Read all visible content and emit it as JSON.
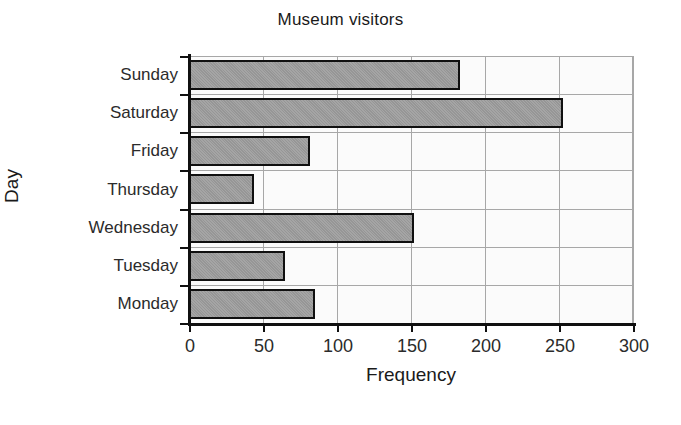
{
  "chart_data": {
    "type": "bar",
    "orientation": "horizontal",
    "title": "Museum visitors",
    "xlabel": "Frequency",
    "ylabel": "Day",
    "categories": [
      "Monday",
      "Tuesday",
      "Wednesday",
      "Thursday",
      "Friday",
      "Saturday",
      "Sunday"
    ],
    "values": [
      85,
      65,
      152,
      44,
      82,
      253,
      183
    ],
    "xlim": [
      0,
      300
    ],
    "xticks": [
      0,
      50,
      100,
      150,
      200,
      250,
      300
    ],
    "xtick_labels": [
      "0",
      "50",
      "100",
      "150",
      "200",
      "250",
      "300"
    ],
    "grid": true,
    "legend": "none",
    "series": [
      {
        "name": "Frequency",
        "values": [
          85,
          65,
          152,
          44,
          82,
          253,
          183
        ]
      }
    ],
    "bars": [
      {
        "category": "Sunday",
        "value": 183
      },
      {
        "category": "Saturday",
        "value": 253
      },
      {
        "category": "Friday",
        "value": 82
      },
      {
        "category": "Thursday",
        "value": 44
      },
      {
        "category": "Wednesday",
        "value": 152
      },
      {
        "category": "Tuesday",
        "value": 65
      },
      {
        "category": "Monday",
        "value": 85
      }
    ]
  },
  "colors": {
    "bar_fill": "#9b9b9b",
    "bar_border": "#101010",
    "grid": "#a7a7a7",
    "axis": "#101010",
    "plot_background": "#fbfbfb",
    "figure_background": "#ffffff",
    "text": "#1a1a1a"
  }
}
